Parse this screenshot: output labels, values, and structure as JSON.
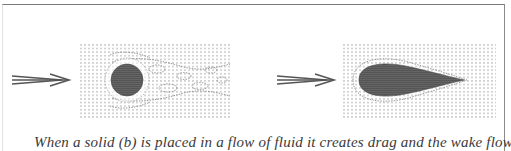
{
  "figure": {
    "panels": [
      {
        "id": "left",
        "label": "Flow around a circular cylinder",
        "object_shape": "cylinder",
        "flow_direction_icon": "arrow-right-icon",
        "wake": "turbulent vortex street"
      },
      {
        "id": "right",
        "label": "Flow around a streamlined teardrop",
        "object_shape": "teardrop",
        "flow_direction_icon": "arrow-right-icon",
        "wake": "smooth streamlines"
      }
    ],
    "caption": "When a solid (b) is placed in a flow of fluid it creates drag and the wake flow can be",
    "colors": {
      "border": "#7a7a7a",
      "object_fill": "#4e4e4e",
      "streamline_dot": "#9a9a9a",
      "arrow": "#5a5a5a",
      "caption_text": "#3a3a3a"
    }
  }
}
